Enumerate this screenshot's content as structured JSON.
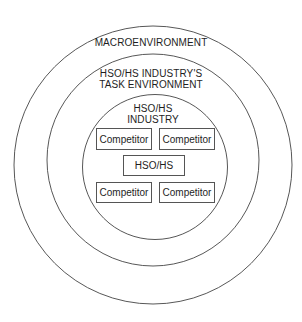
{
  "diagram": {
    "type": "concentric-circles",
    "rings": [
      {
        "name": "outer",
        "label_lines": [
          "MACROENVIRONMENT"
        ]
      },
      {
        "name": "middle",
        "label_lines": [
          "HSO/HS INDUSTRY'S",
          "TASK ENVIRONMENT"
        ]
      },
      {
        "name": "inner",
        "label_lines": [
          "HSO/HS",
          "INDUSTRY"
        ]
      }
    ],
    "boxes": {
      "top_left": "Competitor",
      "top_right": "Competitor",
      "center": "HSO/HS",
      "bottom_left": "Competitor",
      "bottom_right": "Competitor"
    },
    "line_color": "#444444"
  }
}
